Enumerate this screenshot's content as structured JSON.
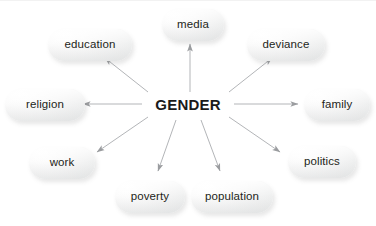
{
  "diagram": {
    "title": "GENDER",
    "type": "radial-concept-map",
    "center": {
      "label": "GENDER",
      "x": 188,
      "y": 104
    },
    "background_color": "#ffffff",
    "node_fill_color": "#ebecec",
    "node_text_color": "#231f20",
    "edge_color": "#a9abae",
    "nodes": [
      {
        "id": "media",
        "label": "media",
        "x": 193,
        "y": 25,
        "w": 62,
        "h": 32,
        "arrow": "up"
      },
      {
        "id": "deviance",
        "label": "deviance",
        "x": 286,
        "y": 45,
        "w": 78,
        "h": 32,
        "arrow": "up-right"
      },
      {
        "id": "family",
        "label": "family",
        "x": 337,
        "y": 105,
        "w": 66,
        "h": 32,
        "arrow": "right"
      },
      {
        "id": "politics",
        "label": "politics",
        "x": 322,
        "y": 162,
        "w": 68,
        "h": 32,
        "arrow": "down-right"
      },
      {
        "id": "population",
        "label": "population",
        "x": 232,
        "y": 197,
        "w": 82,
        "h": 32,
        "arrow": "down-right-steep"
      },
      {
        "id": "poverty",
        "label": "poverty",
        "x": 150,
        "y": 197,
        "w": 70,
        "h": 32,
        "arrow": "down-left-steep"
      },
      {
        "id": "work",
        "label": "work",
        "x": 62,
        "y": 163,
        "w": 66,
        "h": 32,
        "arrow": "down-left"
      },
      {
        "id": "religion",
        "label": "religion",
        "x": 45,
        "y": 105,
        "w": 80,
        "h": 32,
        "arrow": "left"
      },
      {
        "id": "education",
        "label": "education",
        "x": 90,
        "y": 45,
        "w": 84,
        "h": 32,
        "arrow": "up-left"
      }
    ],
    "edges": [
      {
        "from": "GENDER",
        "to": "media"
      },
      {
        "from": "GENDER",
        "to": "deviance"
      },
      {
        "from": "GENDER",
        "to": "family"
      },
      {
        "from": "GENDER",
        "to": "politics"
      },
      {
        "from": "GENDER",
        "to": "population"
      },
      {
        "from": "GENDER",
        "to": "poverty"
      },
      {
        "from": "GENDER",
        "to": "work"
      },
      {
        "from": "GENDER",
        "to": "religion"
      },
      {
        "from": "GENDER",
        "to": "education"
      }
    ]
  }
}
